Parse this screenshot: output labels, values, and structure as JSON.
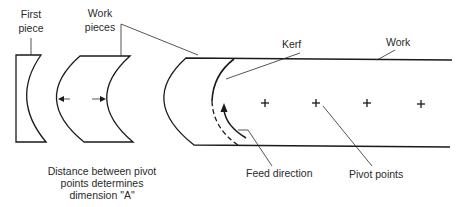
{
  "diagram": {
    "labels": {
      "first_piece": [
        "First",
        "piece"
      ],
      "work_pieces": [
        "Work",
        "pieces"
      ],
      "kerf": "Kerf",
      "work": "Work",
      "feed_direction": "Feed direction",
      "pivot_points": "Pivot points",
      "caption": [
        "Distance between pivot",
        "points determines",
        "dimension \"A\""
      ]
    },
    "pivot_points": [
      {
        "x": 265,
        "y": 103
      },
      {
        "x": 316,
        "y": 103
      },
      {
        "x": 367,
        "y": 103
      },
      {
        "x": 421,
        "y": 103
      }
    ],
    "colors": {
      "line": "#1a1a1a",
      "text": "#2a2a2a",
      "background": "#ffffff"
    }
  }
}
